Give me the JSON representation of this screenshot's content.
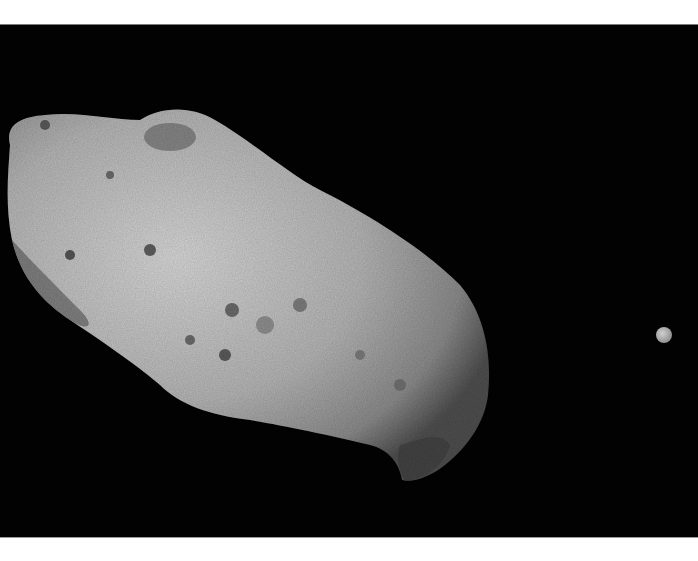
{
  "image": {
    "subject": "asteroid with small moon",
    "background_color": "#020202",
    "frame_color": "#ffffff",
    "asteroid": {
      "tone_light": "#cfcfcf",
      "tone_mid": "#a8a8a8",
      "tone_dark": "#5a5a5a"
    },
    "moon": {
      "cx": 664,
      "cy": 310,
      "r": 8,
      "color": "#b9b9b9"
    }
  }
}
